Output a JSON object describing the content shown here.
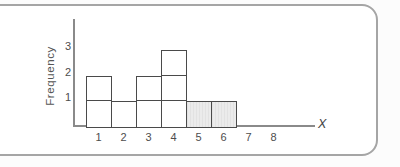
{
  "chart_data": {
    "type": "bar",
    "variant": "histogram-unit-squares",
    "title": "",
    "xlabel": "X",
    "ylabel": "Frequency",
    "categories": [
      "1",
      "2",
      "3",
      "4",
      "5",
      "6",
      "7",
      "8"
    ],
    "values": [
      2,
      1,
      2,
      3,
      1,
      1,
      0,
      0
    ],
    "shaded_categories": [
      "5",
      "6"
    ],
    "yticks": [
      "1",
      "2",
      "3"
    ],
    "ylim": [
      0,
      3.5
    ],
    "xlim": [
      0,
      9
    ],
    "legend": "none",
    "grid": "unit-square-dividers-inside-bars",
    "colors": {
      "bar_fill_default": "#ffffff",
      "bar_fill_shaded": "#e9e9e9",
      "bar_border": "#4a4a4a",
      "axis": "#8a8a8a",
      "text": "#4d4d4d",
      "card_border": "#a5a5a5",
      "card_background": "#ffffff"
    }
  }
}
